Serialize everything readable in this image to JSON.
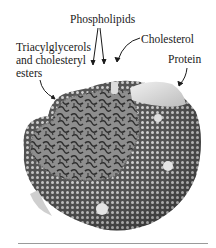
{
  "figure": {
    "labels": {
      "phospholipids": "Phospholipids",
      "triacylglycerols_line1": "Triacylglycerols",
      "triacylglycerols_line2": "and cholesteryl",
      "triacylglycerols_line3": "esters",
      "cholesterol": "Cholesterol",
      "protein": "Protein"
    },
    "colors": {
      "background": "#ffffff",
      "text": "#1a1a1a",
      "shell_dark": "#4a4a4a",
      "shell_bead": "#d8d8d8",
      "core_dark": "#2e2e2e",
      "core_light": "#9c9c9c",
      "protein": "#e2e2e2",
      "rule": "#9a9a9a"
    }
  }
}
